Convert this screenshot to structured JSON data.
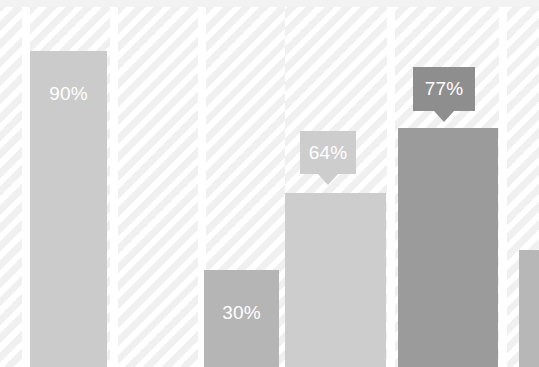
{
  "chart_data": {
    "type": "bar",
    "title": "",
    "subtitle": "",
    "xlabel": "",
    "ylabel": "",
    "ylim": [
      0,
      100
    ],
    "grid": false,
    "legend": null,
    "categories": [
      "",
      "",
      "",
      "",
      ""
    ],
    "values": [
      90,
      30,
      64,
      77,
      34
    ],
    "value_labels": [
      "90%",
      "30%",
      "64%",
      "77%",
      ""
    ],
    "label_style": [
      "inside",
      "inside",
      "callout",
      "callout",
      "none"
    ],
    "series": [
      {
        "name": "",
        "values": [
          90,
          30,
          64,
          77,
          34
        ]
      }
    ],
    "bar_colors": [
      "#cbcbcb",
      "#b5b5b5",
      "#cdcdcd",
      "#9b9b9b",
      "#b7b7b7"
    ]
  },
  "bars": [
    {
      "id": "bar-1",
      "label": "90%",
      "value": 90,
      "color": "#cbcbcb",
      "label_color": "#ffffff",
      "x": 30,
      "width": 77,
      "top": 51
    },
    {
      "id": "bar-2",
      "label": "30%",
      "value": 30,
      "color": "#b5b5b5",
      "label_color": "#ffffff",
      "x": 204,
      "width": 75,
      "top": 270
    },
    {
      "id": "bar-3",
      "label": "64%",
      "value": 64,
      "color": "#cdcdcd",
      "label_color": "#ffffff",
      "x": 285,
      "width": 101,
      "top": 193
    },
    {
      "id": "bar-4",
      "label": "77%",
      "value": 77,
      "color": "#9b9b9b",
      "label_color": "#ffffff",
      "x": 398,
      "width": 100,
      "top": 128
    },
    {
      "id": "bar-5",
      "label": "",
      "value": 34,
      "color": "#b7b7b7",
      "label_color": "#ffffff",
      "x": 519,
      "width": 20,
      "top": 250
    }
  ],
  "callouts": [
    {
      "id": "callout-64",
      "label": "64%",
      "bg": "#cdcdcd",
      "text": "#ffffff",
      "x": 300,
      "y": 131,
      "width": 56,
      "height": 43
    },
    {
      "id": "callout-77",
      "label": "77%",
      "bg": "#8e8e8e",
      "text": "#ffffff",
      "x": 413,
      "y": 67,
      "width": 62,
      "height": 44
    }
  ],
  "stripe_columns": [
    {
      "x": 0,
      "width": 22
    },
    {
      "x": 30,
      "width": 80
    },
    {
      "x": 118,
      "width": 80
    },
    {
      "x": 206,
      "width": 80
    },
    {
      "x": 285,
      "width": 102
    },
    {
      "x": 395,
      "width": 104
    },
    {
      "x": 507,
      "width": 32
    }
  ],
  "colors": {
    "background": "#ffffff",
    "stripe": "#f0f0f0",
    "top_band": "#f2f2f2",
    "bar_light": "#cdcdcd",
    "bar_mid": "#b5b5b5",
    "bar_dark": "#9b9b9b",
    "callout_dark": "#8e8e8e"
  }
}
